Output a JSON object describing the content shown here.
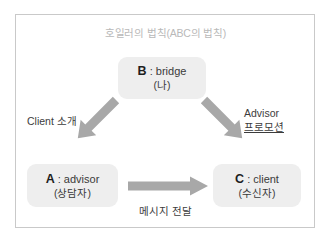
{
  "diagram": {
    "title": "호일러의 법칙(ABC의 법칙)",
    "colors": {
      "node_fill": "#eeeeee",
      "arrow_fill": "#a8a8a8",
      "frame_border": "#c9c9c9",
      "title_text": "#b9b9b9",
      "body_text": "#3a3a3a",
      "background": "#ffffff"
    },
    "nodes": [
      {
        "id": "B",
        "key": "B",
        "separator": " : ",
        "role": "bridge",
        "role_ko": "(나)",
        "line1": "B : bridge",
        "line2": "(나)"
      },
      {
        "id": "A",
        "key": "A",
        "separator": " : ",
        "role": "advisor",
        "role_ko": "(상담자)",
        "line1": "A : advisor",
        "line2": "(상담자)"
      },
      {
        "id": "C",
        "key": "C",
        "separator": " : ",
        "role": "client",
        "role_ko": "(수신자)",
        "line1": "C : client",
        "line2": "(수신자)"
      }
    ],
    "edges": [
      {
        "id": "b-to-a",
        "from": "B",
        "to": "A",
        "direction": "down-left",
        "label_line1": "Client 소개",
        "label_line2": "",
        "label_underline": false
      },
      {
        "id": "b-to-c",
        "from": "B",
        "to": "C",
        "direction": "down-right",
        "label_line1": "Advisor",
        "label_line2": "프로모션",
        "label_underline": true
      },
      {
        "id": "a-to-c",
        "from": "A",
        "to": "C",
        "direction": "right",
        "label_line1": "메시지 전달",
        "label_line2": "",
        "label_underline": false
      }
    ]
  }
}
